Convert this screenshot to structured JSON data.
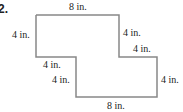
{
  "problem": {
    "number": "2.",
    "shape": "composite rectilinear figure",
    "labels": {
      "top": "8 in.",
      "left": "4 in.",
      "upper_right_vertical": "4 in.",
      "upper_right_horizontal": "4 in.",
      "middle_left_horizontal": "4 in.",
      "middle_left_vertical": "4 in.",
      "lower_right_vertical": "4 in.",
      "bottom": "8 in."
    },
    "colors": {
      "outline": "#888888",
      "text": "#222222"
    }
  }
}
